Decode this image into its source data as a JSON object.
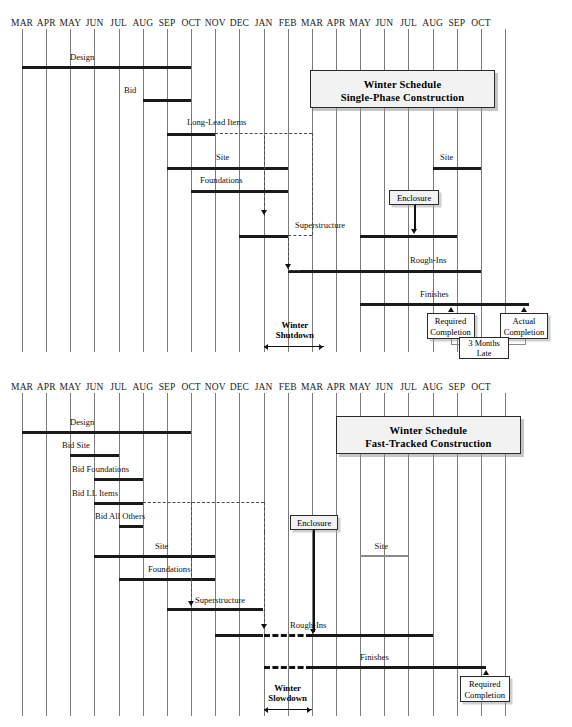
{
  "figure": {
    "type": "gantt-comparison",
    "charts": [
      {
        "id": "chart-single-phase",
        "title_line1": "Winter Schedule",
        "title_line2": "Single-Phase Construction",
        "months": [
          "MAR",
          "APR",
          "MAY",
          "JUN",
          "JUL",
          "AUG",
          "SEP",
          "OCT",
          "NOV",
          "DEC",
          "JAN",
          "FEB",
          "MAR",
          "APR",
          "MAY",
          "JUN",
          "JUL",
          "AUG",
          "SEP",
          "OCT"
        ],
        "tasks": [
          {
            "name": "Design",
            "label": "Design",
            "start": 0,
            "end": 7,
            "style": "solid"
          },
          {
            "name": "Bid",
            "label": "Bid",
            "start": 5,
            "end": 7,
            "style": "solid"
          },
          {
            "name": "Long-Lead Items",
            "label": "Long-Lead Items",
            "start": 6,
            "end": 8,
            "style": "solid"
          },
          {
            "name": "Site",
            "label": "Site",
            "start": 6,
            "end": 11,
            "style": "solid"
          },
          {
            "name": "Foundations",
            "label": "Foundations",
            "start": 7,
            "end": 11,
            "style": "solid"
          },
          {
            "name": "Superstructure",
            "label": "Superstructure",
            "start": 9,
            "end": 11,
            "style": "solid"
          },
          {
            "name": "Superstructure-2",
            "label": "",
            "start": 14,
            "end": 18,
            "style": "solid"
          },
          {
            "name": "Site-2",
            "label": "Site",
            "start": 17,
            "end": 19,
            "style": "solid"
          },
          {
            "name": "Rough-Ins",
            "label": "Rough-Ins",
            "start": 11,
            "end": 19,
            "style": "solid"
          },
          {
            "name": "Finishes",
            "label": "Finishes",
            "start": 14,
            "end": 21,
            "style": "solid"
          }
        ],
        "season_note": {
          "label_line1": "Winter",
          "label_line2": "Shutdown"
        },
        "milestones": [
          {
            "name": "required-completion",
            "line1": "Required",
            "line2": "Completion"
          },
          {
            "name": "actual-completion",
            "line1": "Actual",
            "line2": "Completion"
          }
        ],
        "delay_note": {
          "line1": "3 Months",
          "line2": "Late"
        },
        "enclosure_label": "Enclosure"
      },
      {
        "id": "chart-fast-tracked",
        "title_line1": "Winter Schedule",
        "title_line2": "Fast-Tracked Construction",
        "months": [
          "MAR",
          "APR",
          "MAY",
          "JUN",
          "JUL",
          "AUG",
          "SEP",
          "OCT",
          "NOV",
          "DEC",
          "JAN",
          "FEB",
          "MAR",
          "APR",
          "MAY",
          "JUN",
          "JUL",
          "AUG",
          "SEP",
          "OCT"
        ],
        "tasks": [
          {
            "name": "Design",
            "label": "Design",
            "start": 0,
            "end": 7,
            "style": "solid"
          },
          {
            "name": "Bid Site",
            "label": "Bid Site",
            "start": 2,
            "end": 4,
            "style": "solid"
          },
          {
            "name": "Bid Foundations",
            "label": "Bid Foundations",
            "start": 3,
            "end": 5,
            "style": "solid"
          },
          {
            "name": "Bid LL Items",
            "label": "Bid LL Items",
            "start": 3,
            "end": 5,
            "style": "solid"
          },
          {
            "name": "Bid All Others",
            "label": "Bid All Others",
            "start": 4,
            "end": 5,
            "style": "solid"
          },
          {
            "name": "Site",
            "label": "Site",
            "start": 3,
            "end": 8,
            "style": "solid"
          },
          {
            "name": "Foundations",
            "label": "Foundations",
            "start": 4,
            "end": 8,
            "style": "solid"
          },
          {
            "name": "Superstructure",
            "label": "Superstructure",
            "start": 6,
            "end": 10,
            "style": "solid"
          },
          {
            "name": "Site-2",
            "label": "Site",
            "start": 14,
            "end": 16,
            "style": "gray"
          },
          {
            "name": "Rough-Ins",
            "label": "Rough-Ins",
            "start": 8,
            "end": 17,
            "style": "mixed"
          },
          {
            "name": "Finishes",
            "label": "Finishes",
            "start": 10,
            "end": 19,
            "style": "mixed"
          }
        ],
        "season_note": {
          "label_line1": "Winter",
          "label_line2": "Slowdown"
        },
        "milestones": [
          {
            "name": "required-completion",
            "line1": "Required",
            "line2": "Completion"
          }
        ],
        "enclosure_label": "Enclosure"
      }
    ]
  }
}
